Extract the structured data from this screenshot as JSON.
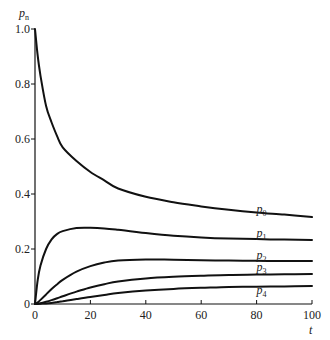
{
  "chart_data": {
    "type": "line",
    "title": "",
    "xlabel": "t",
    "ylabel": "p_n",
    "xlim": [
      0,
      100
    ],
    "ylim": [
      0,
      1.0
    ],
    "grid": false,
    "legend": "inline labels at right end of curves",
    "x_ticks": [
      "0",
      "20",
      "40",
      "60",
      "80",
      "100"
    ],
    "y_ticks": [
      "0",
      "0.2",
      "0.4",
      "0.6",
      "0.8",
      "1.0"
    ],
    "x": [
      0,
      1,
      2,
      4,
      6,
      8,
      10,
      15,
      20,
      25,
      30,
      40,
      50,
      60,
      70,
      80,
      90,
      100
    ],
    "series": [
      {
        "name": "p0",
        "label_main": "p",
        "label_sub": "0",
        "values": [
          1.0,
          0.9,
          0.83,
          0.72,
          0.66,
          0.61,
          0.57,
          0.52,
          0.48,
          0.45,
          0.42,
          0.39,
          0.37,
          0.355,
          0.343,
          0.333,
          0.325,
          0.316
        ]
      },
      {
        "name": "p1",
        "label_main": "p",
        "label_sub": "1",
        "values": [
          0.0,
          0.09,
          0.14,
          0.2,
          0.235,
          0.255,
          0.265,
          0.276,
          0.277,
          0.275,
          0.27,
          0.258,
          0.248,
          0.242,
          0.238,
          0.236,
          0.234,
          0.233
        ]
      },
      {
        "name": "p2",
        "label_main": "p",
        "label_sub": "2",
        "values": [
          0.0,
          0.006,
          0.015,
          0.035,
          0.055,
          0.072,
          0.088,
          0.118,
          0.138,
          0.151,
          0.158,
          0.162,
          0.161,
          0.159,
          0.158,
          0.157,
          0.156,
          0.156
        ]
      },
      {
        "name": "p3",
        "label_main": "p",
        "label_sub": "3",
        "values": [
          0.0,
          0.001,
          0.003,
          0.008,
          0.014,
          0.021,
          0.028,
          0.045,
          0.06,
          0.072,
          0.082,
          0.093,
          0.099,
          0.103,
          0.106,
          0.107,
          0.108,
          0.109
        ]
      },
      {
        "name": "p4",
        "label_main": "p",
        "label_sub": "4",
        "values": [
          0.0,
          0.0,
          0.001,
          0.002,
          0.004,
          0.007,
          0.01,
          0.018,
          0.026,
          0.033,
          0.04,
          0.049,
          0.055,
          0.059,
          0.062,
          0.063,
          0.064,
          0.065
        ]
      }
    ],
    "label_positions": [
      {
        "x": 80,
        "y": 0.33
      },
      {
        "x": 80,
        "y": 0.245
      },
      {
        "x": 80,
        "y": 0.165
      },
      {
        "x": 80,
        "y": 0.12
      },
      {
        "x": 80,
        "y": 0.035
      }
    ]
  },
  "plot_area": {
    "x0": 35,
    "x1": 312,
    "y0": 304,
    "y1": 29
  }
}
